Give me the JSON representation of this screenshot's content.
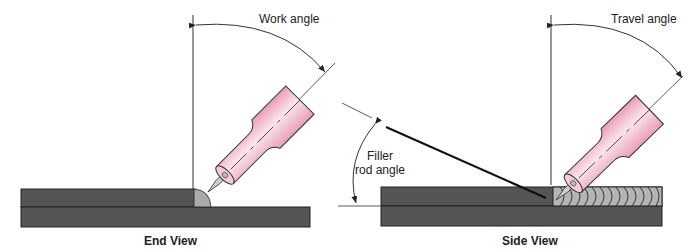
{
  "figure": {
    "end_view": {
      "caption": "End View",
      "angle_label": "Work angle"
    },
    "side_view": {
      "caption": "Side View",
      "angle_label": "Travel angle",
      "filler_label_line1": "Filler",
      "filler_label_line2": "rod angle"
    }
  },
  "colors": {
    "plate": "#555555",
    "plate_edge": "#222222",
    "bead": "#aaaaaa",
    "torch": "#f2b8c8",
    "torch_highlight": "#fbe3ea",
    "line": "#333333"
  }
}
